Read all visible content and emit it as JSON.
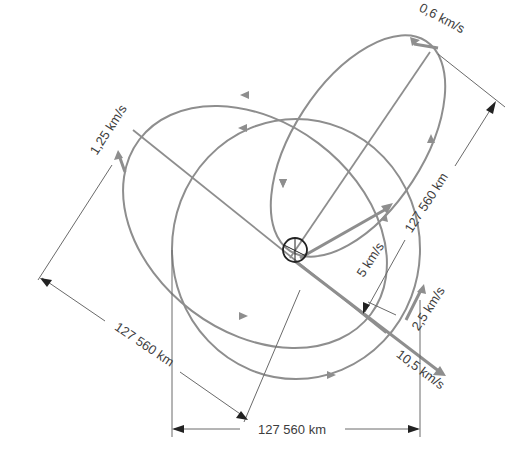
{
  "diagram": {
    "title": "",
    "colors": {
      "orbit": "#8e8e8e",
      "dimension": "#6a6a6a",
      "planet": "#222222",
      "text": "#3d3d3d",
      "background": "#ffffff"
    },
    "velocity_labels": {
      "apogee_narrow_ellipse": "0,6 km/s",
      "apogee_large_ellipse": "1,25 km/s",
      "circular_orbit": "2,5 km/s",
      "perigee_narrow_ellipse": "5 km/s",
      "perigee_large_ellipse": "10,5 km/s"
    },
    "dimension_labels": {
      "bottom_horizontal": "127 560 km",
      "left_diagonal": "127 560 km",
      "right_diagonal": "127 560 km"
    },
    "orbits": [
      {
        "name": "circular-orbit",
        "direction": "counterclockwise"
      },
      {
        "name": "large-ellipse",
        "direction": "counterclockwise"
      },
      {
        "name": "narrow-ellipse",
        "direction": "counterclockwise"
      }
    ],
    "central_body": "planet-symbol"
  }
}
